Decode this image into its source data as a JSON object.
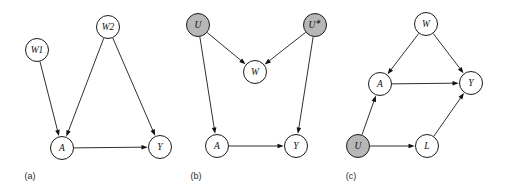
{
  "figure": {
    "width": 511,
    "height": 193,
    "background": "#ffffff",
    "node_stroke": "#1a1a1a",
    "node_fill": "#ffffff",
    "shaded_fill": "#b7b7b7",
    "edge_color": "#1a1a1a",
    "label_color": "#111111",
    "node_radius": 11.5
  },
  "panels": [
    {
      "id": "panel-a",
      "caption": "(a)",
      "caption_x": 30,
      "caption_y": 176,
      "nodes": [
        {
          "id": "a-w1",
          "label": "W1",
          "cx": 37,
          "cy": 50,
          "shaded": false
        },
        {
          "id": "a-w2",
          "label": "W2",
          "cx": 108,
          "cy": 27,
          "shaded": false
        },
        {
          "id": "a-a",
          "label": "A",
          "cx": 62,
          "cy": 148,
          "shaded": false
        },
        {
          "id": "a-y",
          "label": "Y",
          "cx": 160,
          "cy": 147,
          "shaded": false
        }
      ],
      "edges": [
        {
          "id": "a-w1-a",
          "from": "W1",
          "to": "A"
        },
        {
          "id": "a-w2-a",
          "from": "W2",
          "to": "A"
        },
        {
          "id": "a-w2-y",
          "from": "W2",
          "to": "Y"
        },
        {
          "id": "a-a-y",
          "from": "A",
          "to": "Y"
        }
      ]
    },
    {
      "id": "panel-b",
      "caption": "(b)",
      "caption_x": 196,
      "caption_y": 176,
      "nodes": [
        {
          "id": "b-u",
          "label": "U",
          "cx": 198,
          "cy": 25,
          "shaded": true
        },
        {
          "id": "b-us",
          "label": "U*",
          "cx": 315,
          "cy": 25,
          "shaded": true
        },
        {
          "id": "b-w",
          "label": "W",
          "cx": 255,
          "cy": 72,
          "shaded": false
        },
        {
          "id": "b-a",
          "label": "A",
          "cx": 217,
          "cy": 146,
          "shaded": false
        },
        {
          "id": "b-y",
          "label": "Y",
          "cx": 296,
          "cy": 146,
          "shaded": false
        }
      ],
      "edges": [
        {
          "id": "b-u-w",
          "from": "U",
          "to": "W"
        },
        {
          "id": "b-us-w",
          "from": "U*",
          "to": "W"
        },
        {
          "id": "b-u-a",
          "from": "U",
          "to": "A"
        },
        {
          "id": "b-us-y",
          "from": "U*",
          "to": "Y"
        },
        {
          "id": "b-a-y",
          "from": "A",
          "to": "Y"
        }
      ]
    },
    {
      "id": "panel-c",
      "caption": "(c)",
      "caption_x": 351,
      "caption_y": 176,
      "nodes": [
        {
          "id": "c-w",
          "label": "W",
          "cx": 426,
          "cy": 24,
          "shaded": false
        },
        {
          "id": "c-a",
          "label": "A",
          "cx": 380,
          "cy": 84,
          "shaded": false
        },
        {
          "id": "c-y",
          "label": "Y",
          "cx": 471,
          "cy": 83,
          "shaded": false
        },
        {
          "id": "c-u",
          "label": "U",
          "cx": 358,
          "cy": 146,
          "shaded": true
        },
        {
          "id": "c-l",
          "label": "L",
          "cx": 427,
          "cy": 146,
          "shaded": false
        }
      ],
      "edges": [
        {
          "id": "c-w-a",
          "from": "W",
          "to": "A"
        },
        {
          "id": "c-w-y",
          "from": "W",
          "to": "Y"
        },
        {
          "id": "c-a-y",
          "from": "A",
          "to": "Y"
        },
        {
          "id": "c-u-a",
          "from": "U",
          "to": "A"
        },
        {
          "id": "c-u-l",
          "from": "U",
          "to": "L"
        },
        {
          "id": "c-l-y",
          "from": "L",
          "to": "Y"
        }
      ]
    }
  ]
}
